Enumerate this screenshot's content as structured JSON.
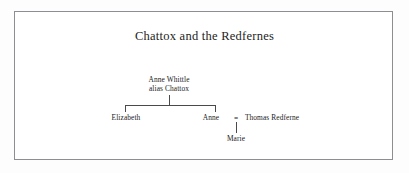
{
  "figure": {
    "title": "Chattox and the Redfernes",
    "frame_color": "#8e8e92",
    "line_color": "#4a4a4a",
    "text_color": "#222222",
    "background": "#ffffff"
  },
  "tree": {
    "parent": {
      "line1": "Anne Whittle",
      "line2": "alias Chattox"
    },
    "children": [
      {
        "name": "Elizabeth"
      },
      {
        "name": "Anne"
      }
    ],
    "spouse": {
      "name": "Thomas Redferne",
      "marriage_symbol": "="
    },
    "grandchild": {
      "name": "Marie"
    }
  }
}
